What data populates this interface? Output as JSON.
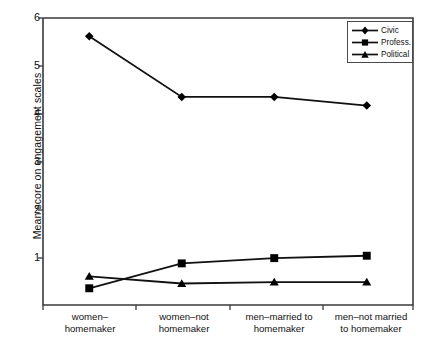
{
  "chart_data": {
    "type": "line",
    "title": "",
    "xlabel": "",
    "ylabel": "Mean score on engagement scales",
    "categories": [
      "women–\nhomemaker",
      "women–not\nhomemaker",
      "men–married to\nhomemaker",
      "men–not married\nto homemaker"
    ],
    "ylim": [
      0,
      6
    ],
    "yticks": [
      1,
      2,
      3,
      4,
      5,
      6
    ],
    "ytick_labels": [
      "1",
      "2",
      "3",
      "4",
      "5",
      "6"
    ],
    "grid": false,
    "legend_position": "top-right",
    "series": [
      {
        "name": "Civic",
        "marker": "diamond",
        "values": [
          5.62,
          4.35,
          4.35,
          4.17
        ]
      },
      {
        "name": "Profess.",
        "marker": "square",
        "values": [
          0.35,
          0.87,
          0.98,
          1.03
        ]
      },
      {
        "name": "Political",
        "marker": "triangle",
        "values": [
          0.6,
          0.45,
          0.48,
          0.48
        ]
      }
    ],
    "colors": {
      "line": "#111111",
      "marker": "#000000",
      "axis": "#333333",
      "background": "#ffffff"
    }
  },
  "legend": {
    "items": [
      {
        "label": "Civic",
        "icon": "diamond-marker-icon"
      },
      {
        "label": "Profess.",
        "icon": "square-marker-icon"
      },
      {
        "label": "Political",
        "icon": "triangle-marker-icon"
      }
    ]
  },
  "axes": {
    "y_title": "Mean score on engagement scales",
    "y_labels": {
      "t6": "6",
      "t5": "5",
      "t4": "4",
      "t3": "3",
      "t2": "2",
      "t1": "1"
    },
    "x_labels": {
      "c0": "women–\nhomemaker",
      "c1": "women–not\nhomemaker",
      "c2": "men–married to\nhomemaker",
      "c3": "men–not married\nto homemaker"
    }
  }
}
